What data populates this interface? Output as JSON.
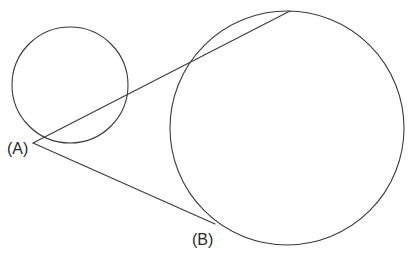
{
  "figure": {
    "kind": "geometry-diagram",
    "background_color": "#ffffff",
    "stroke_color": "#3a3a3a",
    "stroke_width": 1.1,
    "width": 413,
    "height": 260
  },
  "labels": {
    "point_a": "(A)",
    "point_b": "(B)"
  },
  "chart_data": {
    "type": "scatter",
    "title": "",
    "xlabel": "",
    "ylabel": "",
    "shapes": [
      {
        "name": "small-circle",
        "type": "circle",
        "cx": 70,
        "cy": 85,
        "r": 58,
        "fill": "none",
        "stroke": "#3a3a3a"
      },
      {
        "name": "large-circle",
        "type": "circle",
        "cx": 287,
        "cy": 128,
        "r": 117,
        "fill": "none",
        "stroke": "#3a3a3a"
      },
      {
        "name": "upper-tangent-line",
        "type": "line",
        "x1": 33,
        "y1": 143,
        "x2": 290,
        "y2": 11,
        "stroke": "#3a3a3a"
      },
      {
        "name": "lower-tangent-line",
        "type": "line",
        "x1": 33,
        "y1": 143,
        "x2": 215,
        "y2": 224,
        "stroke": "#3a3a3a"
      }
    ],
    "points": [
      {
        "name": "A",
        "label": "(A)",
        "x": 33,
        "y": 143,
        "role": "tangent-lines-intersection"
      },
      {
        "name": "B",
        "label": "(B)",
        "x": 215,
        "y": 224,
        "role": "tangent-point-on-large-circle"
      }
    ]
  }
}
